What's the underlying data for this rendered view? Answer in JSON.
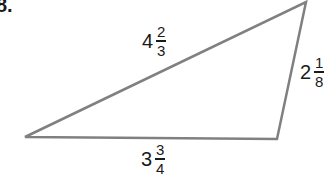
{
  "problem_number": "8.",
  "triangle": {
    "stroke_color": "#808080",
    "vertices": [
      [
        25,
        137
      ],
      [
        306,
        2
      ],
      [
        277,
        139
      ]
    ]
  },
  "sides": {
    "top": {
      "whole": "4",
      "numerator": "2",
      "denominator": "3"
    },
    "right": {
      "whole": "2",
      "numerator": "1",
      "denominator": "8"
    },
    "bottom": {
      "whole": "3",
      "numerator": "3",
      "denominator": "4"
    }
  }
}
